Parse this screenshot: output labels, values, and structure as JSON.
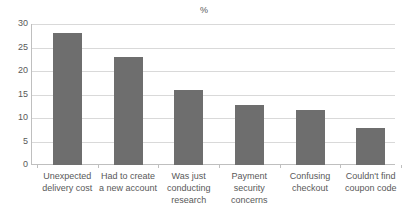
{
  "chart_data": {
    "type": "bar",
    "title": "%",
    "xlabel": "",
    "ylabel": "",
    "categories": [
      "Unexpected delivery cost",
      "Had to create a new account",
      "Was just conducting research",
      "Payment security concerns",
      "Confusing checkout",
      "Couldn't find coupon code"
    ],
    "values": [
      28,
      23,
      16,
      12.7,
      11.6,
      7.8
    ],
    "ylim": [
      0,
      30
    ],
    "yticks": [
      0,
      5,
      10,
      15,
      20,
      25,
      30
    ],
    "ytick_labels": [
      "0",
      "5",
      "10",
      "15",
      "20",
      "25",
      "30"
    ],
    "grid": true,
    "legend": false,
    "series_color": "#6e6e6e",
    "gridline_color": "#d9d9d9",
    "axis_color": "#bfbfbf",
    "text_color": "#595959",
    "background": "#ffffff"
  }
}
